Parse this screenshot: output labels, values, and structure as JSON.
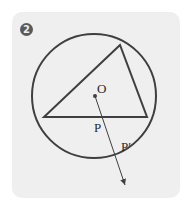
{
  "figure": {
    "badge_number": "2",
    "labels": {
      "center": "O",
      "point_p": "P",
      "point_p_prime": "P′"
    },
    "colors": {
      "panel": "#efefef",
      "stroke": "#3f3f3f",
      "badge": "#5a5a5a"
    },
    "geometry": {
      "circle": {
        "cx": 94,
        "cy": 96,
        "r": 62
      },
      "triangle": [
        [
          120,
          45
        ],
        [
          44,
          117
        ],
        [
          147,
          117
        ]
      ],
      "center_point": [
        95,
        96
      ],
      "ray_end": [
        125,
        186
      ]
    }
  }
}
